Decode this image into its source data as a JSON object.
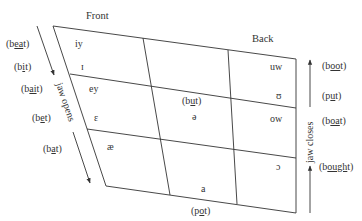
{
  "headers": {
    "front": "Front",
    "back": "Back"
  },
  "axes": {
    "left": "jaw opens",
    "right": "jaw closes"
  },
  "left_words": [
    {
      "pre": "(b",
      "u": "ea",
      "post": "t)"
    },
    {
      "pre": "(b",
      "u": "i",
      "post": "t)"
    },
    {
      "pre": "(b",
      "u": "ai",
      "post": "t)"
    },
    {
      "pre": "(b",
      "u": "e",
      "post": "t)"
    },
    {
      "pre": "(b",
      "u": "a",
      "post": "t)"
    }
  ],
  "right_words": [
    {
      "pre": "(b",
      "u": "oo",
      "post": "t)"
    },
    {
      "pre": "(p",
      "u": "u",
      "post": "t)"
    },
    {
      "pre": "(b",
      "u": "oa",
      "post": "t)"
    },
    {
      "pre": "(b",
      "u": "ough",
      "post": "t)"
    }
  ],
  "center_words": [
    {
      "pre": "(b",
      "u": "u",
      "post": "t)"
    },
    {
      "pre": "(p",
      "u": "o",
      "post": "t)"
    }
  ],
  "vowels": {
    "iy": "iy",
    "ih": "ɪ",
    "ey": "ey",
    "eh": "ɛ",
    "ae": "æ",
    "schwa": "ə",
    "a": "a",
    "uw": "uw",
    "uh": "ʊ",
    "ow": "ow",
    "open_o": "ɔ"
  }
}
